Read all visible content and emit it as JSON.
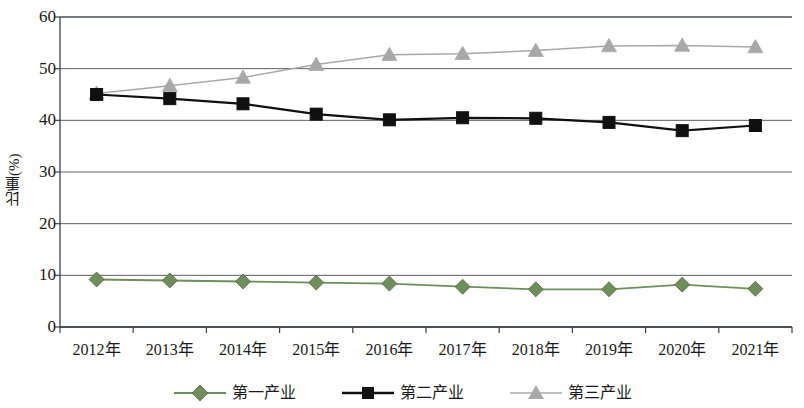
{
  "chart_data": {
    "type": "line",
    "title": "",
    "xlabel": "",
    "ylabel": "比重(%)",
    "ylim": [
      0,
      60
    ],
    "ytick_values": [
      0,
      10,
      20,
      30,
      40,
      50,
      60
    ],
    "ytick_labels": [
      "0",
      "10",
      "20",
      "30",
      "40",
      "50",
      "60"
    ],
    "grid": "horizontal",
    "legend_position": "bottom",
    "categories": [
      "2012年",
      "2013年",
      "2014年",
      "2015年",
      "2016年",
      "2017年",
      "2018年",
      "2019年",
      "2020年",
      "2021年"
    ],
    "series": [
      {
        "name": "第一产业",
        "color": "#6e8f5a",
        "marker": "diamond",
        "values": [
          9.2,
          9.0,
          8.8,
          8.6,
          8.4,
          7.8,
          7.3,
          7.3,
          8.2,
          7.4
        ]
      },
      {
        "name": "第二产业",
        "color": "#101010",
        "marker": "square",
        "values": [
          45.0,
          44.2,
          43.2,
          41.2,
          40.1,
          40.5,
          40.4,
          39.6,
          38.0,
          39.0
        ]
      },
      {
        "name": "第三产业",
        "color": "#a8a8a8",
        "marker": "triangle",
        "values": [
          45.2,
          46.7,
          48.3,
          50.8,
          52.7,
          52.9,
          53.5,
          54.4,
          54.5,
          54.2
        ]
      }
    ]
  },
  "axis": {
    "y_title": "比重(%)"
  },
  "legend": {
    "items": [
      {
        "label": "第一产业"
      },
      {
        "label": "第二产业"
      },
      {
        "label": "第三产业"
      }
    ]
  }
}
